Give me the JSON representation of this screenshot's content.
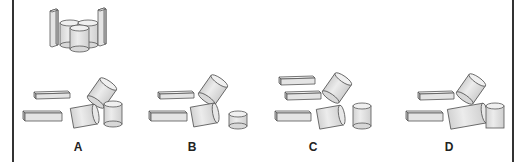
{
  "figure": {
    "type": "spatial-reasoning-puzzle",
    "reference": {
      "description": "assembled figure: two tall rectangular prisms flanking three upright cylinders",
      "pieces": [
        "tall-prism",
        "tall-prism",
        "cylinder",
        "cylinder",
        "cylinder"
      ]
    },
    "options": [
      {
        "label": "A",
        "pieces": [
          "flat-prism",
          "flat-prism",
          "tilted-cylinder",
          "tilted-cylinder",
          "upright-cylinder"
        ]
      },
      {
        "label": "B",
        "pieces": [
          "flat-prism",
          "flat-prism",
          "tilted-cylinder",
          "tilted-cylinder",
          "short-cylinder"
        ]
      },
      {
        "label": "C",
        "pieces": [
          "flat-prism",
          "flat-prism",
          "flat-prism",
          "tilted-cylinder",
          "tilted-cylinder",
          "upright-cylinder"
        ]
      },
      {
        "label": "D",
        "pieces": [
          "flat-prism",
          "flat-prism",
          "tilted-cylinder",
          "long-tilted-cylinder",
          "upright-cylinder"
        ]
      }
    ]
  },
  "colors": {
    "fill": "#e6e6e6",
    "fill_dark": "#c8c8c8",
    "stroke": "#555555",
    "frame": "#333333"
  }
}
